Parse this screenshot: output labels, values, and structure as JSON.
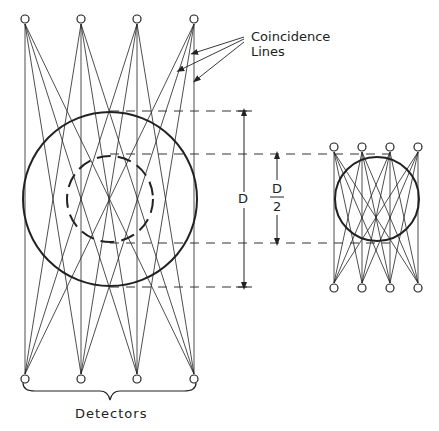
{
  "labels": {
    "coincidence_line1": "Coincidence",
    "coincidence_line2": "Lines",
    "d_label": "D",
    "d_half_num": "D",
    "d_half_den": "2",
    "detectors": "Detectors"
  },
  "geometry": {
    "left_array": {
      "detector_x": [
        25,
        81,
        137,
        194
      ],
      "top_y": 24,
      "bottom_y": 374,
      "circle": {
        "cx": 110,
        "cy": 199,
        "r": 87
      },
      "inner_dashed_circle": {
        "cx": 110,
        "cy": 199,
        "r": 43
      }
    },
    "right_array": {
      "detector_x": [
        334,
        362,
        390,
        418
      ],
      "top_y": 152,
      "bottom_y": 283,
      "circle": {
        "cx": 377,
        "cy": 199,
        "r": 42
      }
    },
    "dimension_D": {
      "x": 244,
      "y1": 111,
      "y2": 287
    },
    "dimension_D_half": {
      "x": 277,
      "y1": 154,
      "y2": 243
    }
  },
  "colors": {
    "ink": "#222222",
    "background": "#ffffff"
  }
}
